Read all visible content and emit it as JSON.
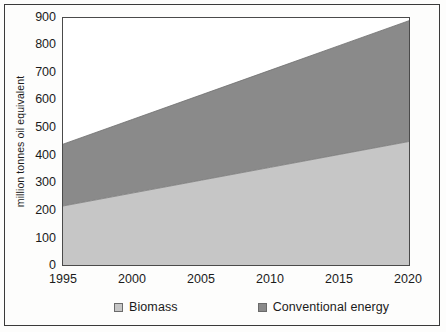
{
  "chart_data": {
    "type": "area",
    "stacked": true,
    "title": "",
    "subtitle": "",
    "xlabel": "",
    "ylabel": "million tonnes oil equivalent",
    "x": [
      1995,
      2000,
      2005,
      2010,
      2015,
      2020
    ],
    "xlim": [
      1995,
      2020
    ],
    "ylim": [
      0,
      900
    ],
    "grid": false,
    "legend_position": "bottom",
    "x_tick_labels": [
      "1995",
      "2000",
      "2005",
      "2010",
      "2015",
      "2020"
    ],
    "y_tick_labels": [
      "0",
      "100",
      "200",
      "300",
      "400",
      "500",
      "600",
      "700",
      "800",
      "900"
    ],
    "y_ticks": [
      0,
      100,
      200,
      300,
      400,
      500,
      600,
      700,
      800,
      900
    ],
    "series": [
      {
        "name": "Biomass",
        "color": "#c6c6c6",
        "values": [
          215,
          262,
          309,
          356,
          403,
          450
        ]
      },
      {
        "name": "Conventional energy",
        "color": "#8a8a8a",
        "values": [
          225,
          261,
          297,
          333,
          369,
          440
        ]
      }
    ],
    "series_cumulative_top": [
      440,
      530,
      620,
      710,
      800,
      890
    ],
    "annotations": []
  },
  "axes": {
    "y_title": "million tonnes oil equivalent",
    "y_tick_labels": [
      "900",
      "800",
      "700",
      "600",
      "500",
      "400",
      "300",
      "200",
      "100",
      "0"
    ],
    "x_tick_labels": [
      "1995",
      "2000",
      "2005",
      "2010",
      "2015",
      "2020"
    ]
  },
  "legend": {
    "items": [
      {
        "label": "Biomass",
        "color": "#c6c6c6"
      },
      {
        "label": "Conventional energy",
        "color": "#8a8a8a"
      }
    ]
  },
  "colors": {
    "biomass": "#c6c6c6",
    "conventional": "#8a8a8a",
    "plot_border": "#4a4a4a",
    "outer_border": "#3a3a3a",
    "text": "#1b1b1b",
    "background": "#fdfdfc"
  }
}
